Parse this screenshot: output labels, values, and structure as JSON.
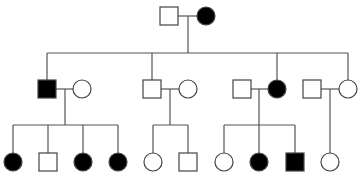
{
  "diagram": {
    "type": "pedigree",
    "colors": {
      "line": "#555555",
      "affected_fill": "#000000",
      "unaffected_fill": "#ffffff",
      "stroke": "#444444"
    },
    "size": 18,
    "individuals": [
      {
        "id": "I-1",
        "generation": 1,
        "sex": "male",
        "affected": false,
        "cx": 169,
        "cy": 16
      },
      {
        "id": "I-2",
        "generation": 1,
        "sex": "female",
        "affected": true,
        "cx": 206,
        "cy": 16
      },
      {
        "id": "II-1",
        "generation": 2,
        "sex": "male",
        "affected": true,
        "cx": 47,
        "cy": 89
      },
      {
        "id": "II-2",
        "generation": 2,
        "sex": "female",
        "affected": false,
        "cx": 82,
        "cy": 89
      },
      {
        "id": "II-3",
        "generation": 2,
        "sex": "male",
        "affected": false,
        "cx": 152,
        "cy": 89
      },
      {
        "id": "II-4",
        "generation": 2,
        "sex": "female",
        "affected": false,
        "cx": 188,
        "cy": 89
      },
      {
        "id": "II-5",
        "generation": 2,
        "sex": "male",
        "affected": false,
        "cx": 242,
        "cy": 89
      },
      {
        "id": "II-6",
        "generation": 2,
        "sex": "female",
        "affected": true,
        "cx": 277,
        "cy": 89
      },
      {
        "id": "II-7",
        "generation": 2,
        "sex": "male",
        "affected": false,
        "cx": 312,
        "cy": 89
      },
      {
        "id": "II-8",
        "generation": 2,
        "sex": "female",
        "affected": false,
        "cx": 348,
        "cy": 89
      },
      {
        "id": "III-1",
        "generation": 3,
        "sex": "female",
        "affected": true,
        "cx": 13,
        "cy": 162
      },
      {
        "id": "III-2",
        "generation": 3,
        "sex": "male",
        "affected": false,
        "cx": 48,
        "cy": 162
      },
      {
        "id": "III-3",
        "generation": 3,
        "sex": "female",
        "affected": true,
        "cx": 83,
        "cy": 162
      },
      {
        "id": "III-4",
        "generation": 3,
        "sex": "female",
        "affected": true,
        "cx": 118,
        "cy": 162
      },
      {
        "id": "III-5",
        "generation": 3,
        "sex": "female",
        "affected": false,
        "cx": 153,
        "cy": 162
      },
      {
        "id": "III-6",
        "generation": 3,
        "sex": "male",
        "affected": false,
        "cx": 188,
        "cy": 162
      },
      {
        "id": "III-7",
        "generation": 3,
        "sex": "female",
        "affected": false,
        "cx": 224,
        "cy": 162
      },
      {
        "id": "III-8",
        "generation": 3,
        "sex": "female",
        "affected": true,
        "cx": 259,
        "cy": 162
      },
      {
        "id": "III-9",
        "generation": 3,
        "sex": "male",
        "affected": true,
        "cx": 295,
        "cy": 162
      },
      {
        "id": "III-10",
        "generation": 3,
        "sex": "female",
        "affected": false,
        "cx": 330,
        "cy": 162
      }
    ],
    "lines": [
      {
        "x1": 178,
        "y1": 16,
        "x2": 197,
        "y2": 16,
        "role": "marriage-I"
      },
      {
        "x1": 188,
        "y1": 16,
        "x2": 188,
        "y2": 53,
        "role": "descent-I"
      },
      {
        "x1": 47,
        "y1": 53,
        "x2": 348,
        "y2": 53,
        "role": "sibship-II"
      },
      {
        "x1": 47,
        "y1": 53,
        "x2": 47,
        "y2": 80,
        "role": "drop-II-1"
      },
      {
        "x1": 152,
        "y1": 53,
        "x2": 152,
        "y2": 80,
        "role": "drop-II-3"
      },
      {
        "x1": 277,
        "y1": 53,
        "x2": 277,
        "y2": 80,
        "role": "drop-II-6"
      },
      {
        "x1": 348,
        "y1": 53,
        "x2": 348,
        "y2": 80,
        "role": "drop-II-8"
      },
      {
        "x1": 56,
        "y1": 89,
        "x2": 73,
        "y2": 89,
        "role": "marriage-II-1"
      },
      {
        "x1": 65,
        "y1": 89,
        "x2": 65,
        "y2": 125,
        "role": "descent-II-1"
      },
      {
        "x1": 13,
        "y1": 125,
        "x2": 118,
        "y2": 125,
        "role": "sibship-III-a"
      },
      {
        "x1": 13,
        "y1": 125,
        "x2": 13,
        "y2": 153,
        "role": "drop"
      },
      {
        "x1": 48,
        "y1": 125,
        "x2": 48,
        "y2": 153,
        "role": "drop"
      },
      {
        "x1": 83,
        "y1": 125,
        "x2": 83,
        "y2": 153,
        "role": "drop"
      },
      {
        "x1": 118,
        "y1": 125,
        "x2": 118,
        "y2": 153,
        "role": "drop"
      },
      {
        "x1": 161,
        "y1": 89,
        "x2": 179,
        "y2": 89,
        "role": "marriage-II-3"
      },
      {
        "x1": 170,
        "y1": 89,
        "x2": 170,
        "y2": 125,
        "role": "descent-II-3"
      },
      {
        "x1": 153,
        "y1": 125,
        "x2": 188,
        "y2": 125,
        "role": "sibship-III-b"
      },
      {
        "x1": 153,
        "y1": 125,
        "x2": 153,
        "y2": 153,
        "role": "drop"
      },
      {
        "x1": 188,
        "y1": 125,
        "x2": 188,
        "y2": 153,
        "role": "drop"
      },
      {
        "x1": 251,
        "y1": 89,
        "x2": 268,
        "y2": 89,
        "role": "marriage-II-5"
      },
      {
        "x1": 259,
        "y1": 89,
        "x2": 259,
        "y2": 125,
        "role": "descent-II-5"
      },
      {
        "x1": 224,
        "y1": 125,
        "x2": 295,
        "y2": 125,
        "role": "sibship-III-c"
      },
      {
        "x1": 224,
        "y1": 125,
        "x2": 224,
        "y2": 153,
        "role": "drop"
      },
      {
        "x1": 259,
        "y1": 125,
        "x2": 259,
        "y2": 153,
        "role": "drop"
      },
      {
        "x1": 295,
        "y1": 125,
        "x2": 295,
        "y2": 153,
        "role": "drop"
      },
      {
        "x1": 321,
        "y1": 89,
        "x2": 339,
        "y2": 89,
        "role": "marriage-II-7"
      },
      {
        "x1": 330,
        "y1": 89,
        "x2": 330,
        "y2": 153,
        "role": "descent-II-7"
      }
    ]
  }
}
